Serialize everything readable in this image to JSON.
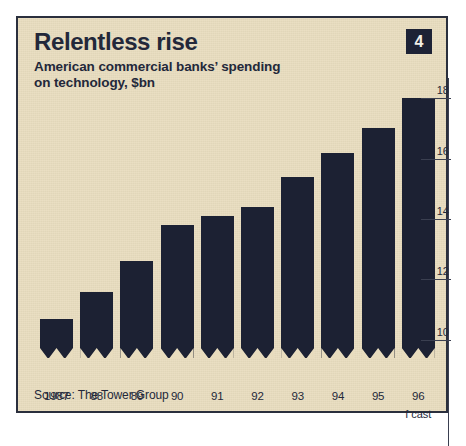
{
  "figure": {
    "title": "Relentless rise",
    "subtitle": "American commercial banks’ spending\non technology, $bn",
    "badge": "4",
    "source": "Source: The Tower Group",
    "colors": {
      "background": "#e8dcbe",
      "bar": "#1c2133",
      "ink": "#23283a",
      "frame": "#2a2f3d",
      "badge_bg": "#1d2235",
      "badge_text": "#f2efe6"
    }
  },
  "chart_data": {
    "type": "bar",
    "title": "Relentless rise",
    "subtitle": "American commercial banks’ spending on technology, $bn",
    "xlabel": "",
    "ylabel": "$bn",
    "categories": [
      "1987",
      "88",
      "89",
      "90",
      "91",
      "92",
      "93",
      "94",
      "95",
      "96"
    ],
    "values": [
      10.7,
      11.6,
      12.6,
      13.8,
      14.1,
      14.4,
      15.4,
      16.2,
      17.0,
      18.0
    ],
    "annotations": [
      {
        "category": "96",
        "text": "f cast"
      }
    ],
    "ylim": [
      9.4,
      18.6
    ],
    "yticks": [
      10,
      12,
      14,
      16,
      18
    ],
    "ytick_labels": [
      "10",
      "12",
      "14",
      "16",
      "18"
    ],
    "axis_position": "right",
    "grid": false,
    "legend": "none",
    "source": "Source: The Tower Group"
  }
}
